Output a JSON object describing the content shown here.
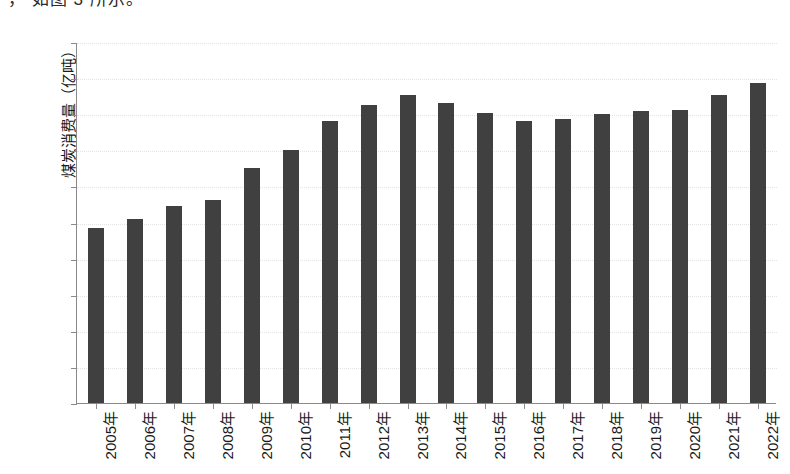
{
  "page": {
    "clipped_header_text": "， 如图 3 所示。"
  },
  "chart_data": {
    "type": "bar",
    "title": "",
    "xlabel": "",
    "ylabel": "煤炭消费量（亿吨）",
    "ylim": [
      0,
      50
    ],
    "ytick_step": 5,
    "grid": true,
    "legend": "none",
    "bar_color": "#404040",
    "axis_color": "#8a8a8a",
    "ytick_labels": [
      "50",
      "45",
      "40",
      "35",
      "30",
      "25",
      "20",
      "15",
      "10",
      "5",
      "0"
    ],
    "ytick_values": [
      50,
      45,
      40,
      35,
      30,
      25,
      20,
      15,
      10,
      5,
      0
    ],
    "categories": [
      "2005年",
      "2006年",
      "2007年",
      "2008年",
      "2009年",
      "2010年",
      "2011年",
      "2012年",
      "2013年",
      "2014年",
      "2015年",
      "2016年",
      "2017年",
      "2018年",
      "2019年",
      "2020年",
      "2021年",
      "2022年"
    ],
    "values": [
      24.3,
      25.5,
      27.3,
      28.1,
      32.5,
      35.0,
      39.1,
      41.3,
      42.6,
      41.6,
      40.1,
      39.1,
      39.3,
      40.0,
      40.4,
      40.6,
      42.6,
      44.3
    ]
  }
}
